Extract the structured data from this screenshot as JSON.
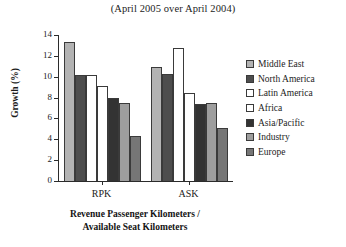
{
  "chart_data": {
    "type": "bar",
    "title": "(April 2005 over April 2004)",
    "xlabel": "Revenue Passenger Kilometers / Available Seat Kilometers",
    "xlabel_line1": "Revenue Passenger Kilometers /",
    "xlabel_line2": "Available Seat Kilometers",
    "ylabel": "Growth (%)",
    "categories": [
      "RPK",
      "ASK"
    ],
    "ylim": [
      0,
      14
    ],
    "yticks": [
      0,
      2,
      4,
      6,
      8,
      10,
      12,
      14
    ],
    "ytick_labels": [
      "0",
      "2",
      "4",
      "6",
      "8",
      "10",
      "12",
      "14"
    ],
    "grid": false,
    "legend_position": "right",
    "series": [
      {
        "name": "Middle East",
        "values": [
          13.3,
          10.9
        ],
        "color": "#b3b3b3"
      },
      {
        "name": "North America",
        "values": [
          10.2,
          10.3
        ],
        "color": "#4d4d4d"
      },
      {
        "name": "Latin America",
        "values": [
          10.2,
          12.8
        ],
        "color": "#ffffff"
      },
      {
        "name": "Africa",
        "values": [
          9.1,
          8.4
        ],
        "color": "#ffffff"
      },
      {
        "name": "Asia/Pacific",
        "values": [
          8.0,
          7.4
        ],
        "color": "#333333"
      },
      {
        "name": "Industry",
        "values": [
          7.5,
          7.5
        ],
        "color": "#9e9e9e"
      },
      {
        "name": "Europe",
        "values": [
          4.3,
          5.1
        ],
        "color": "#767676"
      }
    ]
  },
  "colors": {
    "axis": "#2b2b2b",
    "text": "#1c1c1c",
    "background": "#ffffff"
  }
}
